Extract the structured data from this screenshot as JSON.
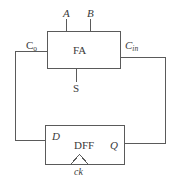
{
  "diagram": {
    "stroke_color": "#5a5a5a",
    "text_color": "#3a3a3a",
    "background": "#ffffff",
    "blocks": [
      {
        "id": "fa",
        "label": "FA",
        "x": 47,
        "y": 31,
        "w": 74,
        "h": 38
      },
      {
        "id": "dff",
        "label": "DFF",
        "x": 45,
        "y": 125,
        "w": 80,
        "h": 40
      }
    ],
    "labels": {
      "a": "A",
      "b": "B",
      "carry_out": "C",
      "carry_out_sub": "o",
      "carry_in": "C",
      "carry_in_sub": "in",
      "fa": "FA",
      "sum": "S",
      "d": "D",
      "dff": "DFF",
      "q": "Q",
      "clock": "ck"
    }
  }
}
